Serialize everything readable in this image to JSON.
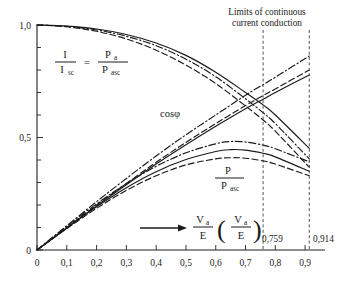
{
  "figure": {
    "title_line1": "Limits of continuous",
    "title_line2": "current conduction"
  },
  "axes": {
    "y_labels": [
      "1,0",
      "0,5",
      "0"
    ],
    "x_labels": [
      "0",
      "0,1",
      "0,2",
      "0,3",
      "0,4",
      "0,5",
      "0,6",
      "0,7",
      "0,8",
      "0,9"
    ]
  },
  "limits": {
    "first_label": "0,759",
    "second_label": "0,914"
  },
  "annotations": {
    "ratio_num_left": "I",
    "ratio_den_left": "I",
    "ratio_den_left_sub": "sc",
    "equals": "=",
    "ratio_num_right": "P",
    "ratio_num_right_sub": "a",
    "ratio_den_right": "P",
    "ratio_den_right_sub": "asc",
    "cos_phi": "cosφ",
    "power_num": "P",
    "power_den": "P",
    "power_den_sub": "asc",
    "xvar_num": "V",
    "xvar_num_sub": "a",
    "xvar_den": "E",
    "xvar_paren_open": "(",
    "xvar_paren_close": ")",
    "xvar2_num": "V",
    "xvar2_num_sub": "a",
    "xvar2_den": "E"
  },
  "chart_data": {
    "type": "line",
    "title": "Limits of continuous current conduction",
    "xlabel": "Va/E (Va/E)",
    "ylabel": "",
    "xlim": [
      0,
      0.95
    ],
    "ylim": [
      0,
      1.05
    ],
    "xticks": [
      0,
      0.1,
      0.2,
      0.3,
      0.4,
      0.5,
      0.6,
      0.7,
      0.8,
      0.9
    ],
    "yticks": [
      0,
      0.5,
      1.0
    ],
    "ytick_labels": [
      "0",
      "0,5",
      "1,0"
    ],
    "grid": false,
    "legend": "none",
    "annotations": [
      {
        "text": "I/Isc = Pa/Pasc",
        "x": 0.23,
        "y": 0.78
      },
      {
        "text": "cosφ",
        "x": 0.52,
        "y": 0.5
      },
      {
        "text": "P/Pasc",
        "x": 0.66,
        "y": 0.26
      },
      {
        "text": "Va/E (Va/E)",
        "x": 0.6,
        "y": 0.1
      }
    ],
    "vertical_lines": [
      {
        "x": 0.759,
        "label": "0,759",
        "style": "dashed"
      },
      {
        "x": 0.914,
        "label": "0,914",
        "style": "dashed"
      }
    ],
    "series": [
      {
        "name": "I/Isc solid",
        "group": "current",
        "style": "solid",
        "x": [
          0,
          0.1,
          0.2,
          0.3,
          0.4,
          0.5,
          0.6,
          0.7,
          0.759,
          0.8,
          0.914
        ],
        "values": [
          1.0,
          0.995,
          0.982,
          0.958,
          0.92,
          0.865,
          0.79,
          0.7,
          0.645,
          0.6,
          0.452
        ]
      },
      {
        "name": "I/Isc dash-dot",
        "group": "current",
        "style": "dashdot",
        "x": [
          0,
          0.1,
          0.2,
          0.3,
          0.4,
          0.5,
          0.6,
          0.7,
          0.759,
          0.8,
          0.914
        ],
        "values": [
          1.0,
          0.994,
          0.978,
          0.95,
          0.908,
          0.848,
          0.77,
          0.672,
          0.61,
          0.562,
          0.405
        ]
      },
      {
        "name": "I/Isc dashed",
        "group": "current",
        "style": "dashed",
        "x": [
          0,
          0.1,
          0.2,
          0.3,
          0.4,
          0.5,
          0.6,
          0.7,
          0.759,
          0.8,
          0.914
        ],
        "values": [
          1.0,
          0.992,
          0.972,
          0.938,
          0.888,
          0.822,
          0.74,
          0.64,
          0.578,
          0.528,
          0.368
        ]
      },
      {
        "name": "cos phi dash-dot",
        "group": "cosphi",
        "style": "dashdot",
        "x": [
          0,
          0.1,
          0.2,
          0.3,
          0.4,
          0.5,
          0.6,
          0.7,
          0.759,
          0.8,
          0.914
        ],
        "values": [
          0,
          0.108,
          0.215,
          0.318,
          0.418,
          0.512,
          0.6,
          0.688,
          0.735,
          0.768,
          0.862
        ]
      },
      {
        "name": "cos phi solid",
        "group": "cosphi",
        "style": "solid",
        "x": [
          0,
          0.1,
          0.2,
          0.3,
          0.4,
          0.5,
          0.6,
          0.7,
          0.759,
          0.8,
          0.914
        ],
        "values": [
          0,
          0.098,
          0.196,
          0.29,
          0.382,
          0.468,
          0.55,
          0.628,
          0.67,
          0.7,
          0.778
        ]
      },
      {
        "name": "cos phi dashed",
        "group": "cosphi",
        "style": "dashed",
        "x": [
          0,
          0.1,
          0.2,
          0.3,
          0.4,
          0.5,
          0.6,
          0.7,
          0.759,
          0.8,
          0.914
        ],
        "values": [
          0,
          0.1,
          0.2,
          0.296,
          0.39,
          0.478,
          0.562,
          0.642,
          0.686,
          0.716,
          0.8
        ]
      },
      {
        "name": "P/Pasc dash-dot",
        "group": "power",
        "style": "dashdot",
        "x": [
          0,
          0.1,
          0.2,
          0.3,
          0.4,
          0.5,
          0.6,
          0.65,
          0.7,
          0.759,
          0.8,
          0.914
        ],
        "values": [
          0,
          0.105,
          0.205,
          0.295,
          0.372,
          0.432,
          0.472,
          0.482,
          0.48,
          0.466,
          0.45,
          0.392
        ]
      },
      {
        "name": "P/Pasc solid",
        "group": "power",
        "style": "solid",
        "x": [
          0,
          0.1,
          0.2,
          0.3,
          0.4,
          0.5,
          0.6,
          0.65,
          0.7,
          0.759,
          0.8,
          0.914
        ],
        "values": [
          0,
          0.098,
          0.192,
          0.277,
          0.348,
          0.402,
          0.438,
          0.446,
          0.444,
          0.43,
          0.414,
          0.35
        ]
      },
      {
        "name": "P/Pasc dashed",
        "group": "power",
        "style": "dashed",
        "x": [
          0,
          0.1,
          0.2,
          0.3,
          0.4,
          0.5,
          0.6,
          0.65,
          0.7,
          0.759,
          0.8,
          0.914
        ],
        "values": [
          0,
          0.095,
          0.185,
          0.265,
          0.33,
          0.378,
          0.405,
          0.41,
          0.408,
          0.396,
          0.382,
          0.33
        ]
      }
    ]
  }
}
